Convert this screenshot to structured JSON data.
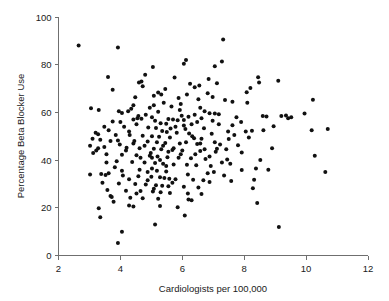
{
  "chart_data": {
    "type": "scatter",
    "title": "",
    "subtitle": "",
    "xlabel": "Cardiologists per 100,000",
    "ylabel": "Percentage Beta Blocker Use",
    "xlim": [
      2,
      12
    ],
    "ylim": [
      0,
      100
    ],
    "xticks": [
      2,
      4,
      6,
      8,
      10,
      12
    ],
    "yticks": [
      0,
      20,
      40,
      60,
      80,
      100
    ],
    "xtick_labels": [
      "2",
      "4",
      "6",
      "8",
      "10",
      "12"
    ],
    "ytick_labels": [
      "0",
      "20",
      "40",
      "60",
      "80",
      "100"
    ],
    "grid": false,
    "legend": null,
    "legend_position": "none",
    "annotations": [],
    "marker": {
      "shape": "circle",
      "color": "#111111",
      "size_px": 4
    },
    "axis_color": "#6f6f6f",
    "background_color": "#ffffff",
    "n_points": 268,
    "points": [
      [
        2.65,
        88.0
      ],
      [
        3.92,
        87.2
      ],
      [
        7.32,
        90.6
      ],
      [
        6.12,
        82.0
      ],
      [
        6.05,
        80.4
      ],
      [
        7.28,
        81.3
      ],
      [
        7.05,
        79.4
      ],
      [
        5.05,
        79.0
      ],
      [
        4.8,
        75.8
      ],
      [
        3.6,
        74.8
      ],
      [
        5.75,
        74.6
      ],
      [
        6.85,
        74.0
      ],
      [
        8.45,
        74.7
      ],
      [
        9.1,
        73.3
      ],
      [
        4.6,
        72.5
      ],
      [
        7.12,
        72.2
      ],
      [
        6.55,
        71.3
      ],
      [
        3.75,
        69.5
      ],
      [
        8.2,
        70.2
      ],
      [
        8.08,
        68.5
      ],
      [
        6.82,
        68.0
      ],
      [
        5.22,
        68.3
      ],
      [
        5.08,
        67.0
      ],
      [
        4.48,
        66.4
      ],
      [
        6.52,
        65.5
      ],
      [
        7.38,
        65.2
      ],
      [
        10.22,
        65.3
      ],
      [
        5.4,
        64.0
      ],
      [
        5.95,
        63.5
      ],
      [
        4.42,
        63.0
      ],
      [
        3.05,
        61.7
      ],
      [
        3.3,
        61.0
      ],
      [
        4.25,
        60.5
      ],
      [
        9.95,
        59.5
      ],
      [
        5.22,
        60.3
      ],
      [
        4.05,
        59.8
      ],
      [
        6.88,
        59.6
      ],
      [
        7.05,
        59.5
      ],
      [
        7.18,
        59.2
      ],
      [
        6.4,
        59.0
      ],
      [
        5.98,
        58.6
      ],
      [
        6.2,
        58.2
      ],
      [
        8.6,
        58.5
      ],
      [
        9.35,
        58.7
      ],
      [
        9.52,
        58.0
      ],
      [
        8.72,
        58.3
      ],
      [
        4.55,
        57.5
      ],
      [
        4.68,
        57.3
      ],
      [
        4.42,
        57.0
      ],
      [
        5.55,
        57.2
      ],
      [
        5.7,
        57.0
      ],
      [
        5.85,
        56.7
      ],
      [
        6.05,
        56.8
      ],
      [
        3.75,
        56.2
      ],
      [
        4.0,
        56.0
      ],
      [
        5.3,
        55.5
      ],
      [
        5.48,
        55.2
      ],
      [
        6.3,
        55.0
      ],
      [
        7.62,
        54.6
      ],
      [
        8.95,
        54.2
      ],
      [
        4.12,
        54.0
      ],
      [
        4.9,
        53.7
      ],
      [
        5.15,
        53.5
      ],
      [
        5.62,
        53.2
      ],
      [
        6.1,
        53.0
      ],
      [
        6.7,
        53.4
      ],
      [
        10.7,
        53.0
      ],
      [
        10.18,
        52.5
      ],
      [
        8.25,
        52.3
      ],
      [
        8.05,
        52.0
      ],
      [
        5.35,
        52.2
      ],
      [
        5.5,
        51.8
      ],
      [
        5.82,
        51.5
      ],
      [
        6.22,
        51.2
      ],
      [
        6.95,
        51.0
      ],
      [
        3.2,
        51.5
      ],
      [
        3.28,
        50.8
      ],
      [
        4.3,
        50.5
      ],
      [
        4.72,
        50.2
      ],
      [
        5.02,
        50.0
      ],
      [
        5.25,
        49.8
      ],
      [
        5.6,
        49.5
      ],
      [
        6.38,
        49.2
      ],
      [
        6.62,
        49.0
      ],
      [
        7.5,
        48.8
      ],
      [
        8.9,
        45.0
      ],
      [
        3.1,
        49.0
      ],
      [
        3.35,
        48.5
      ],
      [
        3.92,
        48.2
      ],
      [
        4.45,
        48.0
      ],
      [
        4.88,
        47.8
      ],
      [
        5.18,
        47.5
      ],
      [
        5.45,
        47.2
      ],
      [
        5.92,
        47.0
      ],
      [
        6.48,
        46.8
      ],
      [
        7.22,
        46.5
      ],
      [
        7.8,
        46.2
      ],
      [
        3.02,
        46.0
      ],
      [
        3.48,
        45.5
      ],
      [
        4.2,
        45.2
      ],
      [
        4.62,
        45.0
      ],
      [
        5.08,
        44.8
      ],
      [
        5.32,
        44.5
      ],
      [
        5.68,
        44.2
      ],
      [
        6.0,
        44.0
      ],
      [
        6.58,
        43.8
      ],
      [
        7.08,
        43.5
      ],
      [
        7.92,
        43.2
      ],
      [
        10.28,
        41.8
      ],
      [
        3.12,
        43.0
      ],
      [
        3.55,
        42.5
      ],
      [
        4.05,
        42.2
      ],
      [
        4.52,
        42.0
      ],
      [
        4.95,
        41.8
      ],
      [
        5.2,
        41.5
      ],
      [
        5.52,
        41.2
      ],
      [
        5.88,
        41.0
      ],
      [
        6.28,
        40.8
      ],
      [
        6.75,
        40.5
      ],
      [
        7.45,
        40.2
      ],
      [
        8.52,
        40.0
      ],
      [
        3.88,
        39.5
      ],
      [
        4.38,
        39.2
      ],
      [
        4.78,
        39.0
      ],
      [
        5.12,
        38.8
      ],
      [
        5.38,
        38.5
      ],
      [
        5.72,
        38.2
      ],
      [
        6.15,
        38.0
      ],
      [
        6.45,
        37.8
      ],
      [
        6.92,
        37.5
      ],
      [
        7.55,
        38.5
      ],
      [
        8.38,
        36.5
      ],
      [
        8.78,
        36.0
      ],
      [
        10.62,
        35.0
      ],
      [
        3.02,
        34.0
      ],
      [
        3.38,
        34.2
      ],
      [
        3.52,
        33.8
      ],
      [
        3.62,
        34.5
      ],
      [
        4.08,
        33.5
      ],
      [
        4.58,
        33.2
      ],
      [
        5.0,
        33.0
      ],
      [
        5.28,
        32.8
      ],
      [
        5.42,
        32.5
      ],
      [
        5.58,
        32.2
      ],
      [
        5.78,
        32.0
      ],
      [
        6.35,
        31.8
      ],
      [
        6.68,
        31.5
      ],
      [
        7.58,
        31.2
      ],
      [
        3.42,
        30.5
      ],
      [
        3.95,
        30.2
      ],
      [
        4.48,
        30.0
      ],
      [
        4.82,
        29.8
      ],
      [
        5.15,
        29.5
      ],
      [
        5.35,
        29.2
      ],
      [
        5.55,
        29.0
      ],
      [
        6.05,
        28.8
      ],
      [
        6.52,
        28.5
      ],
      [
        8.28,
        28.2
      ],
      [
        3.58,
        27.5
      ],
      [
        4.18,
        27.2
      ],
      [
        4.65,
        27.0
      ],
      [
        5.05,
        26.8
      ],
      [
        5.3,
        26.5
      ],
      [
        5.6,
        26.2
      ],
      [
        6.18,
        26.0
      ],
      [
        6.62,
        25.8
      ],
      [
        3.68,
        25.0
      ],
      [
        3.72,
        24.5
      ],
      [
        4.32,
        24.2
      ],
      [
        4.72,
        24.0
      ],
      [
        5.22,
        23.8
      ],
      [
        6.2,
        23.5
      ],
      [
        6.3,
        23.2
      ],
      [
        8.42,
        22.0
      ],
      [
        3.78,
        22.5
      ],
      [
        4.28,
        21.0
      ],
      [
        4.42,
        20.5
      ],
      [
        5.28,
        20.8
      ],
      [
        5.85,
        20.2
      ],
      [
        6.08,
        16.8
      ],
      [
        5.12,
        13.0
      ],
      [
        9.12,
        12.0
      ],
      [
        4.05,
        10.0
      ],
      [
        3.92,
        5.2
      ],
      [
        3.3,
        19.8
      ],
      [
        3.35,
        16.0
      ],
      [
        3.28,
        45.0
      ],
      [
        3.22,
        44.0
      ],
      [
        4.95,
        62.0
      ],
      [
        5.32,
        67.5
      ],
      [
        5.45,
        69.8
      ],
      [
        4.72,
        71.0
      ],
      [
        4.68,
        73.0
      ],
      [
        6.25,
        72.0
      ],
      [
        6.4,
        70.5
      ],
      [
        6.98,
        66.5
      ],
      [
        7.62,
        64.5
      ],
      [
        5.08,
        63.0
      ],
      [
        4.35,
        61.5
      ],
      [
        3.95,
        60.5
      ],
      [
        8.48,
        72.5
      ],
      [
        8.1,
        64.0
      ],
      [
        7.75,
        58.0
      ],
      [
        7.9,
        56.0
      ],
      [
        9.2,
        58.5
      ],
      [
        9.42,
        57.5
      ],
      [
        6.58,
        62.0
      ],
      [
        6.72,
        60.5
      ],
      [
        5.92,
        61.0
      ],
      [
        5.65,
        62.5
      ],
      [
        5.02,
        58.0
      ],
      [
        4.52,
        55.0
      ],
      [
        4.28,
        52.0
      ],
      [
        3.85,
        50.5
      ],
      [
        3.62,
        52.5
      ],
      [
        3.48,
        54.0
      ],
      [
        4.88,
        35.0
      ],
      [
        5.18,
        35.5
      ],
      [
        5.48,
        35.2
      ],
      [
        5.02,
        36.5
      ],
      [
        4.62,
        36.0
      ],
      [
        6.82,
        34.5
      ],
      [
        7.02,
        35.0
      ],
      [
        7.35,
        33.5
      ],
      [
        6.72,
        44.5
      ],
      [
        7.12,
        44.8
      ],
      [
        7.42,
        44.5
      ],
      [
        7.68,
        50.5
      ],
      [
        8.15,
        49.5
      ],
      [
        8.62,
        52.5
      ],
      [
        5.72,
        45.0
      ],
      [
        5.95,
        42.5
      ],
      [
        6.12,
        47.5
      ],
      [
        6.32,
        50.0
      ],
      [
        6.58,
        47.0
      ],
      [
        4.98,
        43.0
      ],
      [
        4.78,
        46.0
      ],
      [
        4.42,
        47.0
      ],
      [
        4.18,
        44.0
      ],
      [
        3.98,
        46.5
      ],
      [
        3.68,
        48.0
      ],
      [
        5.38,
        46.0
      ],
      [
        5.55,
        43.5
      ],
      [
        5.02,
        41.0
      ],
      [
        5.28,
        40.0
      ],
      [
        5.48,
        37.5
      ],
      [
        6.42,
        42.5
      ],
      [
        6.88,
        41.5
      ],
      [
        7.28,
        39.0
      ],
      [
        4.88,
        31.5
      ],
      [
        4.28,
        32.0
      ],
      [
        4.05,
        35.5
      ],
      [
        3.82,
        37.0
      ],
      [
        3.55,
        39.0
      ],
      [
        4.65,
        41.0
      ],
      [
        6.98,
        56.5
      ],
      [
        7.18,
        55.0
      ],
      [
        7.48,
        52.0
      ],
      [
        6.05,
        54.5
      ],
      [
        5.78,
        54.0
      ],
      [
        6.48,
        56.0
      ],
      [
        5.12,
        56.5
      ],
      [
        4.82,
        59.0
      ],
      [
        4.58,
        58.5
      ],
      [
        6.62,
        57.5
      ],
      [
        7.05,
        47.5
      ],
      [
        6.18,
        34.0
      ],
      [
        5.68,
        30.5
      ],
      [
        5.08,
        28.0
      ],
      [
        4.52,
        26.0
      ],
      [
        6.88,
        30.8
      ],
      [
        7.92,
        35.8
      ],
      [
        8.32,
        31.8
      ],
      [
        6.15,
        67.5
      ],
      [
        5.88,
        66.0
      ]
    ]
  }
}
